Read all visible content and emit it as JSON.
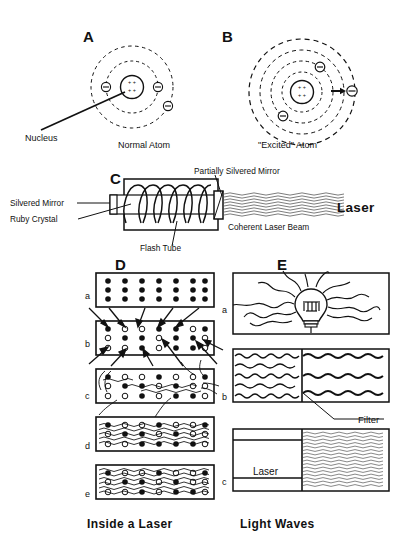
{
  "figure": {
    "background": "#ffffff",
    "ink": "#111111"
  },
  "panels": {
    "a": {
      "letter": "A",
      "caption": "Normal Atom",
      "nucleus_label": "Nucleus",
      "nucleus_charges": "+ + +",
      "electron_symbol": "−",
      "orbit_count": 2,
      "electron_count": 3
    },
    "b": {
      "letter": "B",
      "caption": "\"Excited\" Atom",
      "electron_symbol": "−",
      "nucleus_charges": "+ + +",
      "orbit_count": 4,
      "electron_count": 3
    },
    "c": {
      "letter": "C",
      "labels": {
        "silvered_mirror": "Silvered Mirror",
        "ruby_crystal": "Ruby Crystal",
        "flash_tube": "Flash Tube",
        "partially_silvered_mirror": "Partially Silvered Mirror",
        "coherent_beam": "Coherent Laser Beam",
        "laser_word": "Laser"
      }
    },
    "d": {
      "letter": "D",
      "caption": "Inside a Laser",
      "rows": [
        {
          "id": "a",
          "note": "all atoms in ground state"
        },
        {
          "id": "b",
          "note": "pumping energy in"
        },
        {
          "id": "c",
          "note": "stimulated emission begins"
        },
        {
          "id": "d",
          "note": "waves building"
        },
        {
          "id": "e",
          "note": "coherent amplification"
        }
      ],
      "row_labels": [
        "a",
        "b",
        "c",
        "d",
        "e"
      ],
      "grid": {
        "columns": 7,
        "dot_rows": 3
      }
    },
    "e": {
      "letter": "E",
      "caption": "Light Waves",
      "row_labels": [
        "a",
        "b",
        "c"
      ],
      "filter_label": "Filter",
      "laser_box_label": "Laser",
      "rows": [
        {
          "id": "a",
          "note": "incandescent bulb radiating incoherent light"
        },
        {
          "id": "b",
          "note": "white light through a filter"
        },
        {
          "id": "c",
          "note": "laser produces coherent light"
        }
      ]
    }
  },
  "captions": {
    "left": "Inside a Laser",
    "right": "Light Waves"
  }
}
